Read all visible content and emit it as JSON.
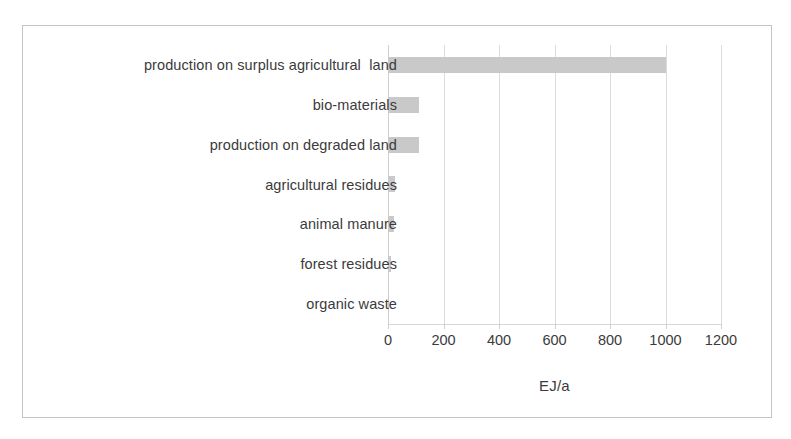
{
  "chart_data": {
    "type": "bar",
    "orientation": "horizontal",
    "title": "",
    "subtitle": "",
    "xlabel": "EJ/a",
    "ylabel": "",
    "categories": [
      "production on surplus agricultural  land",
      "bio-materials",
      "production on degraded land",
      "agricultural residues",
      "animal manure",
      "forest residues",
      "organic waste"
    ],
    "values": [
      1000,
      110,
      110,
      25,
      20,
      12,
      2
    ],
    "series": [
      {
        "name": "biomass potential",
        "values": [
          1000,
          110,
          110,
          25,
          20,
          12,
          2
        ]
      }
    ],
    "xlim": [
      0,
      1200
    ],
    "xticks": [
      0,
      200,
      400,
      600,
      800,
      1000,
      1200
    ],
    "xtick_labels": [
      "0",
      "200",
      "400",
      "600",
      "800",
      "1000",
      "1200"
    ],
    "grid": "vertical",
    "legend": "none",
    "bar_color": "#c9c9c9",
    "gridline_color": "#dcdcdc",
    "text_color": "#3b3b3b",
    "frame_color": "#c4c4c4",
    "units": "EJ/a"
  }
}
